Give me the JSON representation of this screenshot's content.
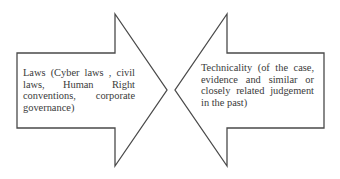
{
  "diagram": {
    "type": "opposing-arrows",
    "stroke_color": "#4a4a4a",
    "fill_color": "#ffffff",
    "text_color": "#3a3a3a",
    "left_arrow": {
      "direction": "right",
      "text": "Laws (Cyber laws , civil laws, Human Right conventions, corporate governance)"
    },
    "right_arrow": {
      "direction": "left",
      "text": "Technicality (of the case, evidence and similar or closely related judgement in the past)"
    }
  }
}
